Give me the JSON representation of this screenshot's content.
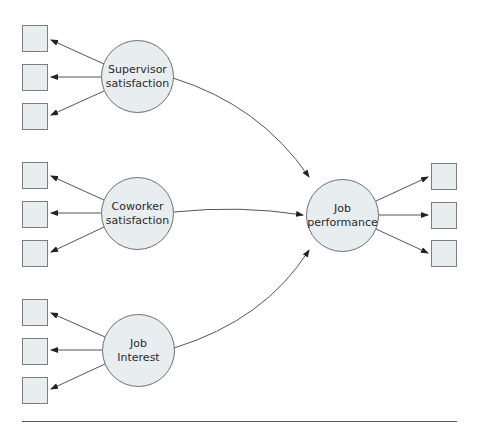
{
  "diagram": {
    "type": "structural-equation-model",
    "colors": {
      "fill": "#e8edf0",
      "stroke": "#6e6e6e",
      "arrow": "#333333"
    },
    "latent_variables": [
      {
        "id": "supervisor",
        "label": "Supervisor\nsatisfaction",
        "indicators": 3,
        "role": "exogenous"
      },
      {
        "id": "coworker",
        "label": "Coworker\nsatisfaction",
        "indicators": 3,
        "role": "exogenous"
      },
      {
        "id": "interest",
        "label": "Job\nInterest",
        "indicators": 3,
        "role": "exogenous"
      },
      {
        "id": "performance",
        "label": "Job\nperformance",
        "indicators": 3,
        "role": "endogenous"
      }
    ],
    "paths": [
      {
        "from": "supervisor",
        "to": "performance"
      },
      {
        "from": "coworker",
        "to": "performance"
      },
      {
        "from": "interest",
        "to": "performance"
      }
    ]
  }
}
